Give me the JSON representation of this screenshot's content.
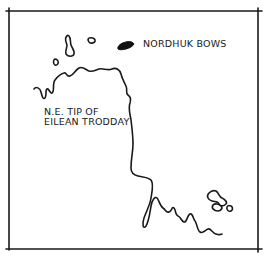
{
  "panel": {
    "type": "hand-drawn comic map panel",
    "stroke_color": "#1a1a1a",
    "background_color": "#ffffff"
  },
  "labels": {
    "nordhuk_bows": "NORDHUK BOWS",
    "tip_line1": "N.E. TIP OF",
    "tip_line2": "EILEAN TRODDAY"
  },
  "features": [
    {
      "name": "frame",
      "kind": "border"
    },
    {
      "name": "coastline",
      "kind": "land outline"
    },
    {
      "name": "elongated-island",
      "kind": "island outline"
    },
    {
      "name": "small-oval-island",
      "kind": "island outline"
    },
    {
      "name": "tiny-island",
      "kind": "island outline"
    },
    {
      "name": "nordhuk-bows-marker",
      "kind": "filled island / ship marker"
    },
    {
      "name": "southeast-islands",
      "kind": "island outlines"
    }
  ]
}
